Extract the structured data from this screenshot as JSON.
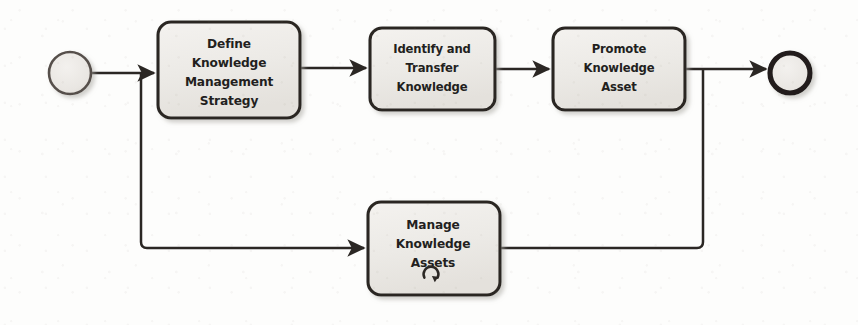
{
  "diagram": {
    "type": "bpmn-process-flow",
    "background_color": "#fdfdfc",
    "stroke_color": "#2b2724",
    "node_fill_color": "#efedea",
    "start_event": {
      "name": "start-event",
      "shape": "circle",
      "label": "",
      "cx": 70,
      "cy": 73,
      "r": 21,
      "stroke_width": 2.6
    },
    "end_event": {
      "name": "end-event",
      "shape": "circle",
      "label": "",
      "cx": 790,
      "cy": 73,
      "r": 20,
      "stroke_width": 5.2
    },
    "tasks": [
      {
        "id": "define-knowledge-management-strategy",
        "lines": [
          "Define",
          "Knowledge",
          "Management",
          "Strategy"
        ],
        "x": 158,
        "y": 22,
        "width": 142,
        "height": 96,
        "marker": ""
      },
      {
        "id": "identify-and-transfer-knowledge",
        "lines": [
          "Identify and",
          "Transfer",
          "Knowledge"
        ],
        "x": 370,
        "y": 28,
        "width": 125,
        "height": 82,
        "marker": ""
      },
      {
        "id": "promote-knowledge-asset",
        "lines": [
          "Promote",
          "Knowledge",
          "Asset"
        ],
        "x": 553,
        "y": 28,
        "width": 132,
        "height": 82,
        "marker": ""
      },
      {
        "id": "manage-knowledge-assets",
        "lines": [
          "Manage",
          "Knowledge",
          "Assets"
        ],
        "x": 368,
        "y": 202,
        "width": 132,
        "height": 93,
        "marker": "loop-marker"
      }
    ],
    "sequence_flows": [
      {
        "id": "flow-start-to-define",
        "from": "start-event",
        "to": "define-knowledge-management-strategy",
        "path": "M 92 73 L 154 73",
        "arrow": true
      },
      {
        "id": "flow-define-to-identify",
        "from": "define-knowledge-management-strategy",
        "to": "identify-and-transfer-knowledge",
        "path": "M 300 68 L 366 68",
        "arrow": true
      },
      {
        "id": "flow-identify-to-promote",
        "from": "identify-and-transfer-knowledge",
        "to": "promote-knowledge-asset",
        "path": "M 495 69 L 549 69",
        "arrow": true
      },
      {
        "id": "flow-promote-to-end",
        "from": "promote-knowledge-asset",
        "to": "end-event",
        "path": "M 685 69 L 766 69",
        "arrow": true
      },
      {
        "id": "flow-branch-to-manage",
        "from": "start-event",
        "to": "manage-knowledge-assets",
        "path": "M 141 74 L 141 248 L 364 248",
        "arrow": true
      },
      {
        "id": "flow-manage-to-end",
        "from": "manage-knowledge-assets",
        "to": "end-event",
        "path": "M 500 248 L 703 248 L 703 69",
        "arrow": false
      }
    ]
  }
}
